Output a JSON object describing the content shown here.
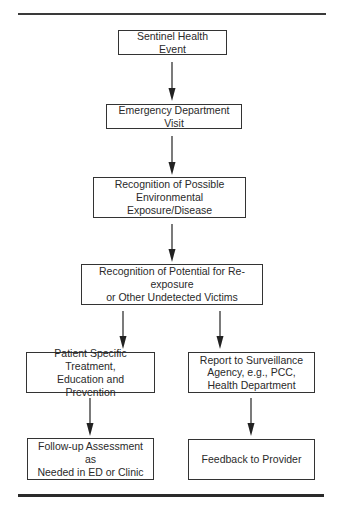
{
  "diagram": {
    "type": "flowchart",
    "nodes": [
      {
        "id": "n1",
        "lines": [
          "Sentinel Health Event"
        ]
      },
      {
        "id": "n2",
        "lines": [
          "Emergency Department Visit"
        ]
      },
      {
        "id": "n3",
        "lines": [
          "Recognition of Possible",
          "Environmental Exposure/Disease"
        ]
      },
      {
        "id": "n4",
        "lines": [
          "Recognition of Potential for Re-exposure",
          "or Other Undetected Victims"
        ]
      },
      {
        "id": "n5",
        "lines": [
          "Patient Specific Treatment,",
          "Education and Prevention"
        ]
      },
      {
        "id": "n6",
        "lines": [
          "Follow-up Assessment as",
          "Needed in ED or Clinic"
        ]
      },
      {
        "id": "n7",
        "lines": [
          "Report to Surveillance",
          "Agency, e.g., PCC,",
          "Health Department"
        ]
      },
      {
        "id": "n8",
        "lines": [
          "Feedback to Provider"
        ]
      }
    ],
    "edges": [
      {
        "from": "n1",
        "to": "n2"
      },
      {
        "from": "n2",
        "to": "n3"
      },
      {
        "from": "n3",
        "to": "n4"
      },
      {
        "from": "n4",
        "to": "n5"
      },
      {
        "from": "n4",
        "to": "n7"
      },
      {
        "from": "n5",
        "to": "n6"
      },
      {
        "from": "n7",
        "to": "n8"
      }
    ]
  }
}
